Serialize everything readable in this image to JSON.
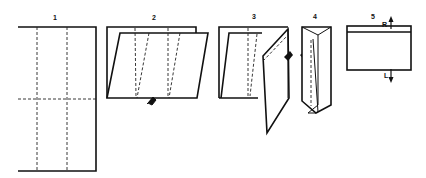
{
  "diagram": {
    "type": "paper-folding-instructions",
    "steps": [
      {
        "label": "1",
        "description": "Unfolded sheet with two vertical dashed fold lines and one horizontal dashed fold line"
      },
      {
        "label": "2",
        "description": "Sheet folded in half, slanted dashed fold lines, fold arrow at bottom"
      },
      {
        "label": "3",
        "description": "Right panel folded over along slanted line, arrow indicating fold"
      },
      {
        "label": "4",
        "description": "Folded narrow tube shape, arrow indicating fold"
      },
      {
        "label": "5",
        "description": "Final rectangle with top strip, arrows marked R (up) and L (down)"
      }
    ],
    "arrow_labels": {
      "right": "R",
      "left": "L"
    },
    "colors": {
      "ink": "#111111",
      "background": "#ffffff"
    }
  }
}
